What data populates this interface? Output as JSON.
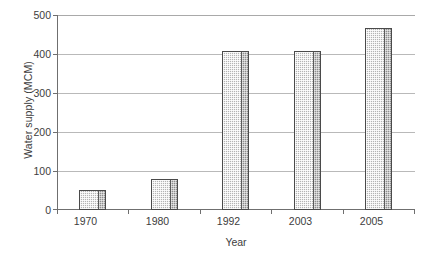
{
  "chart_data": {
    "type": "bar",
    "title": "",
    "subtitle": "",
    "categories": [
      "1970",
      "1980",
      "1992",
      "2003",
      "2005"
    ],
    "values": [
      50,
      80,
      407,
      407,
      467
    ],
    "xlabel": "Year",
    "ylabel": "Water supply (MCM)",
    "ylim": [
      0,
      500
    ],
    "ytick_labels": [
      "0",
      "100",
      "200",
      "300",
      "400",
      "500"
    ],
    "ytick_values": [
      0,
      100,
      200,
      300,
      400,
      500
    ],
    "ytick_interval": 100,
    "grid": "horizontal",
    "legend": "none",
    "annotations": [],
    "series": [
      {
        "name": "Water supply",
        "values": [
          50,
          80,
          407,
          407,
          467
        ]
      }
    ]
  },
  "style": {
    "bar_fill_color": "#b4b4b4",
    "bar_side_color": "#8e8e8e",
    "bar_outline_color": "#4a4a4a",
    "gridline_color": "#b9b9b9",
    "axis_color": "#6f6f6f",
    "text_color": "#3d3d3d",
    "background_color": "#ffffff"
  }
}
